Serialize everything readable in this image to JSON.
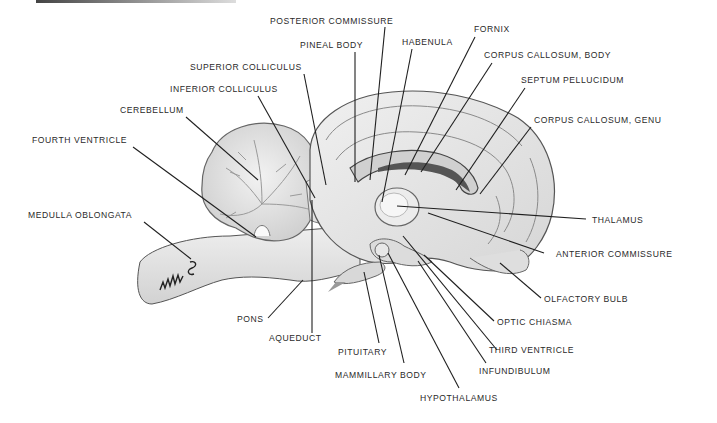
{
  "diagram": {
    "colors": {
      "line": "#1f1f1f",
      "tissue": "#e4e4e4",
      "tissue_shadow": "#bdbdbd",
      "text": "#2a2a2a",
      "background": "#ffffff"
    },
    "labels": [
      {
        "id": "posterior-commissure",
        "text": "POSTERIOR COMMISSURE",
        "x": 270,
        "y": 16
      },
      {
        "id": "fornix",
        "text": "FORNIX",
        "x": 474,
        "y": 24
      },
      {
        "id": "pineal-body",
        "text": "PINEAL BODY",
        "x": 300,
        "y": 40
      },
      {
        "id": "habenula",
        "text": "HABENULA",
        "x": 402,
        "y": 37
      },
      {
        "id": "corpus-callosum-body",
        "text": "CORPUS CALLOSUM, BODY",
        "x": 484,
        "y": 50
      },
      {
        "id": "superior-colliculus",
        "text": "SUPERIOR COLLICULUS",
        "x": 190,
        "y": 62
      },
      {
        "id": "septum-pellucidum",
        "text": "SEPTUM PELLUCIDUM",
        "x": 521,
        "y": 75
      },
      {
        "id": "inferior-colliculus",
        "text": "INFERIOR COLLICULUS",
        "x": 170,
        "y": 84
      },
      {
        "id": "cerebellum",
        "text": "CEREBELLUM",
        "x": 120,
        "y": 105
      },
      {
        "id": "corpus-callosum-genu",
        "text": "CORPUS CALLOSUM, GENU",
        "x": 534,
        "y": 115
      },
      {
        "id": "fourth-ventricle",
        "text": "FOURTH VENTRICLE",
        "x": 32,
        "y": 135
      },
      {
        "id": "medulla-oblongata",
        "text": "MEDULLA OBLONGATA",
        "x": 28,
        "y": 210
      },
      {
        "id": "thalamus",
        "text": "THALAMUS",
        "x": 592,
        "y": 215
      },
      {
        "id": "anterior-commissure",
        "text": "ANTERIOR COMMISSURE",
        "x": 556,
        "y": 249
      },
      {
        "id": "olfactory-bulb",
        "text": "OLFACTORY BULB",
        "x": 544,
        "y": 294
      },
      {
        "id": "pons",
        "text": "PONS",
        "x": 237,
        "y": 314
      },
      {
        "id": "optic-chiasma",
        "text": "OPTIC CHIASMA",
        "x": 497,
        "y": 317
      },
      {
        "id": "aqueduct",
        "text": "AQUEDUCT",
        "x": 269,
        "y": 333
      },
      {
        "id": "pituitary",
        "text": "PITUITARY",
        "x": 338,
        "y": 347
      },
      {
        "id": "third-ventricle",
        "text": "THIRD VENTRICLE",
        "x": 489,
        "y": 345
      },
      {
        "id": "infundibulum",
        "text": "INFUNDIBULUM",
        "x": 479,
        "y": 366
      },
      {
        "id": "mammillary-body",
        "text": "MAMMILLARY BODY",
        "x": 335,
        "y": 370
      },
      {
        "id": "hypothalamus",
        "text": "HYPOTHALAMUS",
        "x": 420,
        "y": 393
      }
    ],
    "leaders": [
      {
        "id": "posterior-commissure",
        "x1": 385,
        "y1": 27,
        "x2": 370,
        "y2": 180
      },
      {
        "id": "fornix",
        "x1": 475,
        "y1": 37,
        "x2": 405,
        "y2": 175
      },
      {
        "id": "pineal-body",
        "x1": 355,
        "y1": 52,
        "x2": 355,
        "y2": 182
      },
      {
        "id": "habenula",
        "x1": 412,
        "y1": 49,
        "x2": 382,
        "y2": 202
      },
      {
        "id": "corpus-callosum-body",
        "x1": 492,
        "y1": 63,
        "x2": 421,
        "y2": 172
      },
      {
        "id": "superior-colliculus",
        "x1": 304,
        "y1": 74,
        "x2": 326,
        "y2": 185
      },
      {
        "id": "septum-pellucidum",
        "x1": 525,
        "y1": 88,
        "x2": 456,
        "y2": 190
      },
      {
        "id": "inferior-colliculus",
        "x1": 258,
        "y1": 96,
        "x2": 315,
        "y2": 198
      },
      {
        "id": "cerebellum",
        "x1": 186,
        "y1": 117,
        "x2": 258,
        "y2": 180
      },
      {
        "id": "corpus-callosum-genu",
        "x1": 531,
        "y1": 127,
        "x2": 480,
        "y2": 194
      },
      {
        "id": "fourth-ventricle",
        "x1": 133,
        "y1": 147,
        "x2": 256,
        "y2": 237
      },
      {
        "id": "medulla-oblongata",
        "x1": 144,
        "y1": 222,
        "x2": 191,
        "y2": 259
      },
      {
        "id": "thalamus",
        "x1": 586,
        "y1": 219,
        "x2": 397,
        "y2": 206
      },
      {
        "id": "anterior-commissure",
        "x1": 544,
        "y1": 253,
        "x2": 428,
        "y2": 213
      },
      {
        "id": "olfactory-bulb",
        "x1": 541,
        "y1": 298,
        "x2": 500,
        "y2": 263
      },
      {
        "id": "pons",
        "x1": 268,
        "y1": 318,
        "x2": 303,
        "y2": 280
      },
      {
        "id": "optic-chiasma",
        "x1": 494,
        "y1": 321,
        "x2": 424,
        "y2": 255
      },
      {
        "id": "aqueduct",
        "x1": 312,
        "y1": 333,
        "x2": 312,
        "y2": 200
      },
      {
        "id": "pituitary",
        "x1": 379,
        "y1": 343,
        "x2": 364,
        "y2": 272
      },
      {
        "id": "third-ventricle",
        "x1": 497,
        "y1": 350,
        "x2": 403,
        "y2": 236
      },
      {
        "id": "infundibulum",
        "x1": 486,
        "y1": 363,
        "x2": 418,
        "y2": 261
      },
      {
        "id": "mammillary-body",
        "x1": 404,
        "y1": 363,
        "x2": 379,
        "y2": 255
      },
      {
        "id": "hypothalamus",
        "x1": 459,
        "y1": 388,
        "x2": 388,
        "y2": 253
      }
    ]
  }
}
